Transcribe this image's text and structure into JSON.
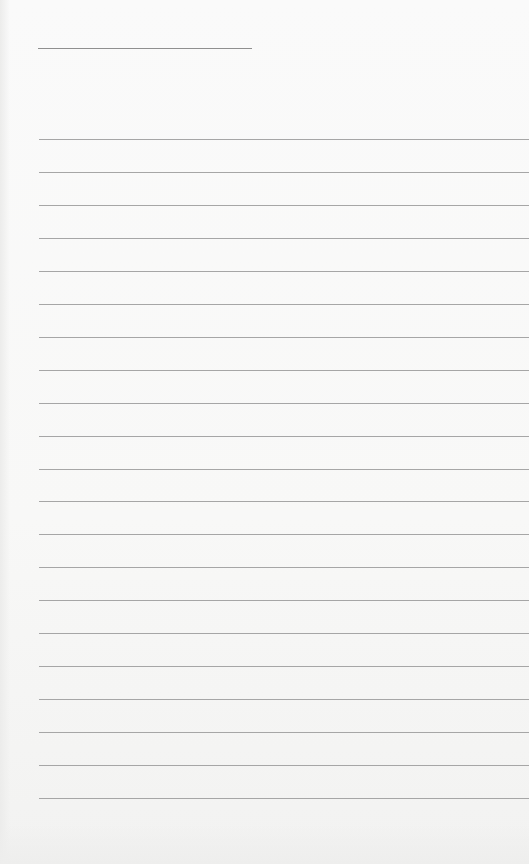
{
  "document": {
    "type": "blank lined paper",
    "title_line": {
      "text": ""
    },
    "ruled_lines_count": 21,
    "lines": [
      "",
      "",
      "",
      "",
      "",
      "",
      "",
      "",
      "",
      "",
      "",
      "",
      "",
      "",
      "",
      "",
      "",
      "",
      "",
      "",
      ""
    ]
  },
  "colors": {
    "paper": "#f8f8f7",
    "rule": "#a6a6a6",
    "title_rule": "#8f8f8f"
  }
}
